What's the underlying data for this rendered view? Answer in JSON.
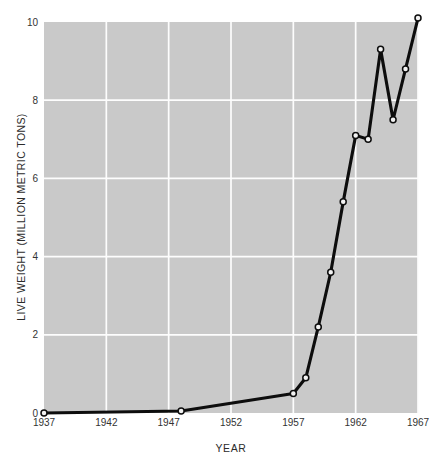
{
  "chart_data": {
    "type": "line",
    "title": "",
    "xlabel": "YEAR",
    "ylabel": "LIVE WEIGHT (MILLION METRIC TONS)",
    "xlim": [
      1937,
      1967
    ],
    "ylim": [
      0,
      10
    ],
    "grid": true,
    "legend": "none",
    "xticks": [
      1937,
      1942,
      1947,
      1952,
      1957,
      1962,
      1967
    ],
    "xtick_labels": [
      "1937",
      "1942",
      "1947",
      "1952",
      "1957",
      "1962",
      "1967"
    ],
    "yticks": [
      0,
      2,
      4,
      6,
      8,
      10
    ],
    "ytick_labels": [
      "0",
      "2",
      "4",
      "6",
      "8",
      "10"
    ],
    "marker": "open-circle",
    "line_color": "#0d0d0d",
    "plot_background_color": "#c9c9c9",
    "grid_color": "#fdfdfd",
    "page_background_color": "#ffffff",
    "x": [
      1937,
      1948,
      1957,
      1958,
      1959,
      1960,
      1961,
      1962,
      1963,
      1964,
      1965,
      1966,
      1967
    ],
    "values": [
      0.0,
      0.05,
      0.5,
      0.9,
      2.2,
      3.6,
      5.4,
      7.1,
      7.0,
      9.3,
      7.5,
      8.8,
      10.1
    ],
    "series": [
      {
        "name": "Live weight",
        "values": [
          0.0,
          0.05,
          0.5,
          0.9,
          2.2,
          3.6,
          5.4,
          7.1,
          7.0,
          9.3,
          7.5,
          8.8,
          10.1
        ]
      }
    ]
  }
}
